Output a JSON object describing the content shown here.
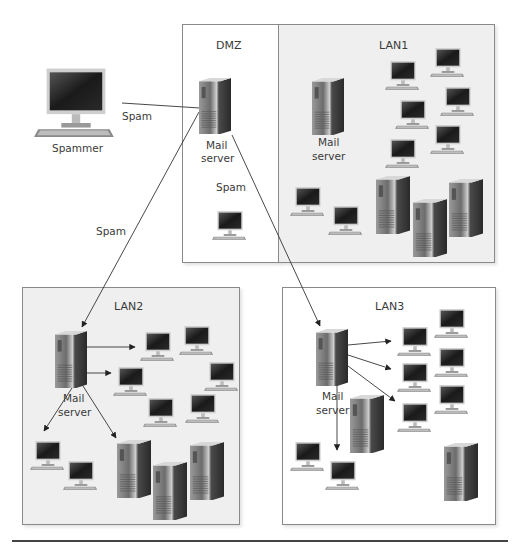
{
  "diagram": {
    "zones": [
      {
        "id": "dmz",
        "title": "DMZ",
        "bg": "#ffffff"
      },
      {
        "id": "lan1",
        "title": "LAN1",
        "bg": "#efefef"
      },
      {
        "id": "lan2",
        "title": "LAN2",
        "bg": "#efefef"
      },
      {
        "id": "lan3",
        "title": "LAN3",
        "bg": "#ffffff"
      }
    ],
    "nodes": {
      "spammer": {
        "label": "Spammer",
        "type": "desktop-computer"
      },
      "dmz_mail_server": {
        "label_line1": "Mail",
        "label_line2": "server",
        "type": "tower-server"
      },
      "lan1_mail_server": {
        "label_line1": "Mail",
        "label_line2": "server",
        "type": "tower-server"
      },
      "lan2_mail_server": {
        "label_line1": "Mail",
        "label_line2": "server",
        "type": "tower-server"
      },
      "lan3_mail_server": {
        "label_line1": "Mail",
        "label_line2": "server",
        "type": "tower-server"
      }
    },
    "edge_labels": {
      "spammer_to_dmz": "Spam",
      "dmz_internal": "Spam",
      "dmz_to_lan2": "Spam"
    },
    "counts": {
      "dmz_workstations": 1,
      "lan1_workstations": 8,
      "lan1_towers": 3,
      "lan2_workstations": 8,
      "lan2_towers": 3,
      "lan3_workstations": 8,
      "lan3_towers": 2
    },
    "colors": {
      "line": "#333333",
      "box_border": "#8a8a8a",
      "screen": "#1c1c1c"
    }
  }
}
